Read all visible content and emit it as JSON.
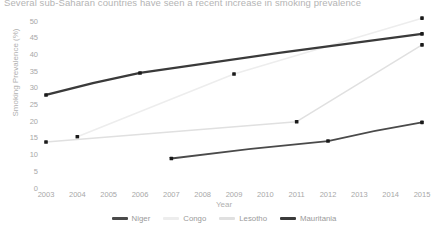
{
  "chart_data": {
    "type": "line",
    "title": "Several sub-Saharan countries have seen a recent increase in smoking prevalence",
    "xlabel": "Year",
    "ylabel": "Smoking Prevalence (%)",
    "xlim": [
      2002.6,
      2015.4
    ],
    "ylim": [
      0,
      51.5
    ],
    "x_ticks": [
      2003,
      2004,
      2005,
      2006,
      2007,
      2008,
      2009,
      2010,
      2011,
      2012,
      2013,
      2014,
      2015
    ],
    "y_ticks": [
      0,
      5,
      10,
      15,
      20,
      25,
      30,
      35,
      40,
      45,
      50
    ],
    "grid": false,
    "legend_position": "bottom",
    "markers": true,
    "series": [
      {
        "name": "Niger",
        "color": "#4a4a4a",
        "width": 1.9,
        "x": [
          2007,
          2012,
          2015
        ],
        "values": [
          9.0,
          14.2,
          19.8
        ]
      },
      {
        "name": "Congo",
        "color": "#ededed",
        "width": 1.5,
        "x": [
          2004,
          2009,
          2015
        ],
        "values": [
          15.5,
          34.3,
          51.0
        ]
      },
      {
        "name": "Lesotho",
        "color": "#e0e0e0",
        "width": 1.5,
        "x": [
          2003,
          2011,
          2015
        ],
        "values": [
          13.9,
          20.0,
          43.0
        ]
      },
      {
        "name": "Mauritania",
        "color": "#3a3a3a",
        "width": 2.3,
        "x": [
          2003,
          2006,
          2015
        ],
        "values": [
          28.0,
          34.6,
          46.3
        ]
      }
    ]
  }
}
